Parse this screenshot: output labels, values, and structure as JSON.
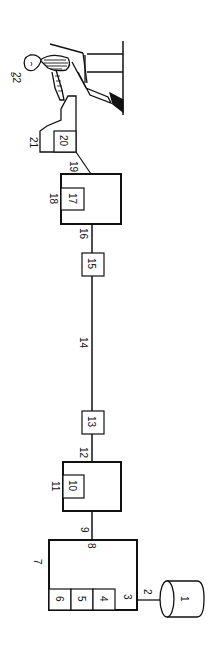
{
  "figure": {
    "orientation": "rotated-90-clockwise",
    "colors": {
      "line": "#111111",
      "background": "#ffffff"
    },
    "components": [
      {
        "id": "1",
        "label": "1",
        "shape": "cylinder"
      },
      {
        "id": "2",
        "label": "2",
        "shape": "connection"
      },
      {
        "id": "3",
        "label": "3",
        "shape": "port"
      },
      {
        "id": "4",
        "label": "4",
        "shape": "box"
      },
      {
        "id": "5",
        "label": "5",
        "shape": "box"
      },
      {
        "id": "6",
        "label": "6",
        "shape": "box"
      },
      {
        "id": "7",
        "label": "7",
        "shape": "box"
      },
      {
        "id": "8",
        "label": "8",
        "shape": "port"
      },
      {
        "id": "9",
        "label": "9",
        "shape": "connection"
      },
      {
        "id": "10",
        "label": "10",
        "shape": "box"
      },
      {
        "id": "11",
        "label": "11",
        "shape": "box"
      },
      {
        "id": "12",
        "label": "12",
        "shape": "connection"
      },
      {
        "id": "13",
        "label": "13",
        "shape": "box"
      },
      {
        "id": "14",
        "label": "14",
        "shape": "connection"
      },
      {
        "id": "15",
        "label": "15",
        "shape": "box"
      },
      {
        "id": "16",
        "label": "16",
        "shape": "connection"
      },
      {
        "id": "17",
        "label": "17",
        "shape": "box"
      },
      {
        "id": "18",
        "label": "18",
        "shape": "box"
      },
      {
        "id": "19",
        "label": "19",
        "shape": "connection"
      },
      {
        "id": "20",
        "label": "20",
        "shape": "box"
      },
      {
        "id": "21",
        "label": "21",
        "shape": "terminal"
      },
      {
        "id": "22",
        "label": "22",
        "shape": "operator"
      }
    ],
    "labels": {
      "l1": "1",
      "l2": "2",
      "l3": "3",
      "l4": "4",
      "l5": "5",
      "l6": "6",
      "l7": "7",
      "l8": "8",
      "l9": "9",
      "l10": "10",
      "l11": "11",
      "l12": "12",
      "l13": "13",
      "l14": "14",
      "l15": "15",
      "l16": "16",
      "l17": "17",
      "l18": "18",
      "l19": "19",
      "l20": "20",
      "l21": "21",
      "l22": "22"
    }
  }
}
